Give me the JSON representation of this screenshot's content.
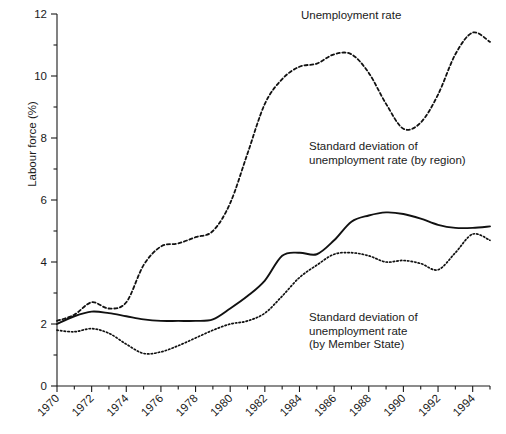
{
  "chart_data": {
    "type": "line",
    "title": "",
    "xlabel": "",
    "ylabel": "Labour force (%)",
    "xlim": [
      1970,
      1995
    ],
    "ylim": [
      0,
      12
    ],
    "grid": false,
    "legend_position": "inline-annotations",
    "y_ticks": [
      "0",
      "2",
      "4",
      "6",
      "8",
      "10",
      "12"
    ],
    "y_tick_values": [
      0,
      2,
      4,
      6,
      8,
      10,
      12
    ],
    "y_minor_tick_values": [
      1,
      3,
      5,
      7,
      9,
      11
    ],
    "x_ticks": [
      "1970",
      "1972",
      "1974",
      "1976",
      "1978",
      "1980",
      "1982",
      "1984",
      "1986",
      "1988",
      "1990",
      "1992",
      "1994"
    ],
    "x_tick_values": [
      1970,
      1972,
      1974,
      1976,
      1978,
      1980,
      1982,
      1984,
      1986,
      1988,
      1990,
      1992,
      1994
    ],
    "x_minor_tick_values": [
      1971,
      1973,
      1975,
      1977,
      1979,
      1981,
      1983,
      1985,
      1987,
      1989,
      1991,
      1993,
      1995
    ],
    "x": [
      1970,
      1971,
      1972,
      1973,
      1974,
      1975,
      1976,
      1977,
      1978,
      1979,
      1980,
      1981,
      1982,
      1983,
      1984,
      1985,
      1986,
      1987,
      1988,
      1989,
      1990,
      1991,
      1992,
      1993,
      1994,
      1995
    ],
    "series": [
      {
        "name": "Unemployment rate",
        "style": "dashed",
        "color": "#111111",
        "annotation": "Unemployment rate",
        "values": [
          2.1,
          2.3,
          2.7,
          2.5,
          2.7,
          3.9,
          4.5,
          4.6,
          4.8,
          5.0,
          5.9,
          7.5,
          9.1,
          9.9,
          10.3,
          10.4,
          10.7,
          10.7,
          10.1,
          9.1,
          8.3,
          8.5,
          9.4,
          10.7,
          11.4,
          11.1
        ]
      },
      {
        "name": "Standard deviation of unemployment rate (by region)",
        "style": "solid",
        "color": "#111111",
        "annotation": "Standard deviation of\nunemployment rate (by region)",
        "values": [
          2.0,
          2.25,
          2.4,
          2.35,
          2.25,
          2.15,
          2.1,
          2.1,
          2.1,
          2.15,
          2.5,
          2.9,
          3.4,
          4.2,
          4.3,
          4.25,
          4.7,
          5.3,
          5.5,
          5.6,
          5.55,
          5.4,
          5.2,
          5.1,
          5.1,
          5.15
        ]
      },
      {
        "name": "Standard deviation of unemployment rate (by Member State)",
        "style": "dotted",
        "color": "#111111",
        "annotation": "Standard deviation of\nunemployment rate\n(by Member State)",
        "values": [
          1.8,
          1.75,
          1.85,
          1.7,
          1.35,
          1.05,
          1.1,
          1.3,
          1.55,
          1.8,
          2.0,
          2.1,
          2.35,
          2.9,
          3.5,
          3.9,
          4.25,
          4.3,
          4.2,
          4.0,
          4.05,
          3.95,
          3.75,
          4.3,
          4.9,
          4.7
        ]
      }
    ],
    "series_extra_tail": {
      "note_solid_end": 6.1,
      "note_dotted_end": 4.7
    }
  },
  "annotations": {
    "unemployment": "Unemployment rate",
    "by_region": "Standard deviation of\nunemployment rate (by region)",
    "by_member_state": "Standard deviation of\nunemployment rate\n(by Member State)"
  },
  "axes": {
    "y_axis_title": "Labour force (%)"
  }
}
